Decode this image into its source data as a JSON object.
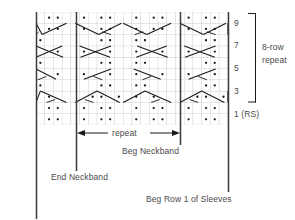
{
  "chart_data": {
    "type": "table",
    "grid": {
      "columns": 22,
      "rows": 10,
      "cell_width": 8.72,
      "cell_height": 11.3,
      "left": 36,
      "top": 12,
      "grid_line_color": "#cfcfcf",
      "symbol_color": "#1a1a1a"
    },
    "row_labels": [
      {
        "row": 9,
        "label": "9"
      },
      {
        "row": 7,
        "label": "7"
      },
      {
        "row": 5,
        "label": "5"
      },
      {
        "row": 3,
        "label": "3"
      },
      {
        "row": 1,
        "label": "1 (RS)"
      }
    ],
    "repeat_bracket": {
      "label_line1": "8-row",
      "label_line2": "repeat",
      "covers_rows": [
        3,
        10
      ]
    },
    "repeat_arrow_label": "repeat",
    "markers": [
      {
        "name": "End Neckband",
        "label": "End Neckband",
        "x": 76
      },
      {
        "name": "Beg Neckband",
        "label": "Beg Neckband",
        "x": 180
      },
      {
        "name": "Beg Row 1 of Sleeves",
        "label": "Beg Row 1 of Sleeves",
        "x": 228
      }
    ],
    "symbols": {
      "purl": "purl-dot",
      "cable_cross": "cable-crossing-line"
    },
    "colors": {
      "marker_line": "#3a3a3a",
      "text": "#4a4a4a",
      "grid": "#d2d2d2",
      "symbol": "#1a1a1a",
      "background": "#ffffff"
    },
    "xlabel": "",
    "ylabel": "",
    "legend": []
  },
  "labels": {
    "row_9": "9",
    "row_7": "7",
    "row_5": "5",
    "row_3": "3",
    "row_1": "1 (RS)",
    "repeat_8row_line1": "8-row",
    "repeat_8row_line2": "repeat",
    "repeat_arrow": "repeat",
    "beg_neckband": "Beg Neckband",
    "end_neckband": "End Neckband",
    "beg_row1_sleeves": "Beg Row 1 of Sleeves"
  }
}
